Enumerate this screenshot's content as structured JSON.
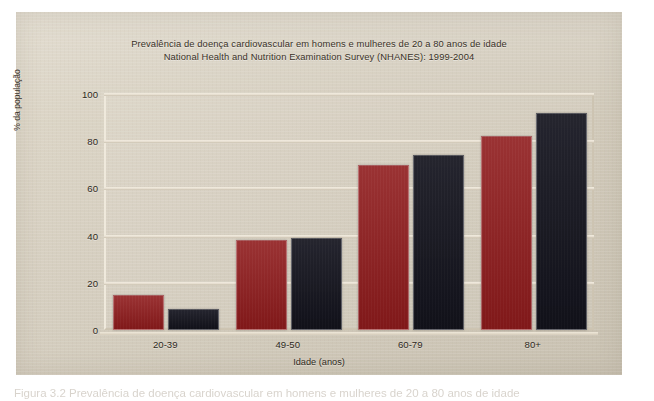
{
  "figure": {
    "caption_partial": "Figura 3.2 Prevalência de doença cardiovascular em homens e mulheres de 20 a 80 anos de idade"
  },
  "chart_data": {
    "type": "bar",
    "title": "Prevalência de doença cardiovascular em homens e mulheres de 20 a 80 anos de idade",
    "subtitle": "National Health and Nutrition Examination Survey (NHANES): 1999-2004",
    "xlabel": "Idade (anos)",
    "ylabel": "% da população",
    "categories": [
      "20-39",
      "49-50",
      "60-79",
      "80+"
    ],
    "series": [
      {
        "name": "Homens",
        "color": "#8f1b1c",
        "values": [
          15,
          38,
          70,
          82
        ]
      },
      {
        "name": "Mulheres",
        "color": "#14141e",
        "values": [
          9,
          39,
          74,
          92
        ]
      }
    ],
    "ylim": [
      0,
      100
    ],
    "yticks": [
      0,
      20,
      40,
      60,
      80,
      100
    ],
    "grid": true,
    "legend": "none"
  },
  "colors": {
    "panel_background": "#d6cebd",
    "gridline": "#e6ded0",
    "text": "#2f2a22",
    "series_red": "#8f1b1c",
    "series_dark": "#14141e"
  }
}
